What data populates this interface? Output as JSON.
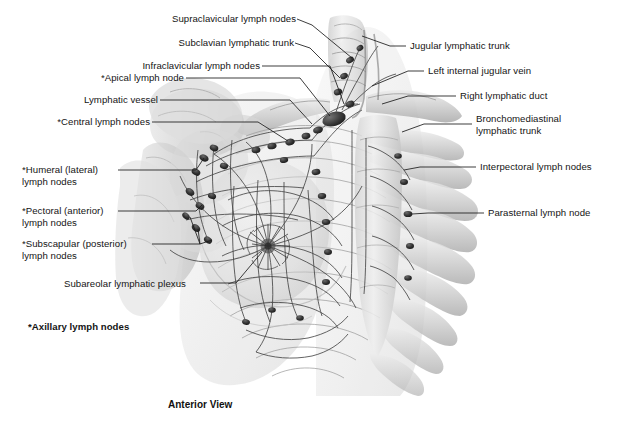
{
  "figure": {
    "title_caption": "Anterior View",
    "footnote": "*Axillary lymph nodes",
    "colors": {
      "background": "#ffffff",
      "leader_line": "#1b1b1b",
      "label_text": "#141414",
      "lymph_node": "#2e2e2e",
      "lymph_vessel": "#3a3a3a",
      "bone_light": "#e4e4e4",
      "bone_mid": "#c9c9c9",
      "bone_dark": "#a8a8a8",
      "soft_tissue": "#dcdcdc"
    }
  },
  "labels_left": [
    {
      "id": "supraclavicular",
      "text": "Supraclavicular lymph nodes"
    },
    {
      "id": "subclavian-trunk",
      "text": "Subclavian lymphatic trunk"
    },
    {
      "id": "infraclavicular",
      "text": "Infraclavicular lymph nodes"
    },
    {
      "id": "apical",
      "text": "*Apical lymph node"
    },
    {
      "id": "lymphatic-vessel",
      "text": "Lymphatic vessel"
    },
    {
      "id": "central",
      "text": "*Central lymph nodes"
    },
    {
      "id": "humeral",
      "text": "*Humeral (lateral)\nlymph nodes"
    },
    {
      "id": "pectoral",
      "text": "*Pectoral (anterior)\nlymph nodes"
    },
    {
      "id": "subscapular",
      "text": "*Subscapular (posterior)\nlymph nodes"
    },
    {
      "id": "subareolar",
      "text": "Subareolar lymphatic plexus"
    }
  ],
  "labels_right": [
    {
      "id": "jugular-trunk",
      "text": "Jugular lymphatic trunk"
    },
    {
      "id": "internal-jugular-vein",
      "text": "Left internal jugular vein"
    },
    {
      "id": "right-lymphatic-duct",
      "text": "Right lymphatic duct"
    },
    {
      "id": "bronchomediastinal",
      "text": "Bronchomediastinal\nlymphatic trunk"
    },
    {
      "id": "interpectoral",
      "text": "Interpectoral lymph nodes"
    },
    {
      "id": "parasternal",
      "text": "Parasternal lymph node"
    }
  ]
}
